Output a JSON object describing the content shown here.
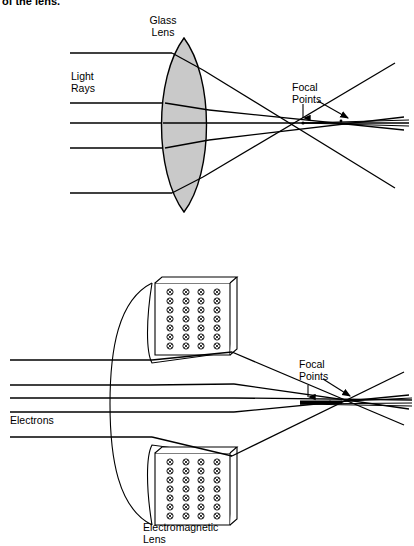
{
  "page": {
    "width": 414,
    "height": 546,
    "background": "#ffffff",
    "ink": "#000000",
    "clipped_text_top": "of the lens."
  },
  "figure": {
    "title_visible": false,
    "panels": [
      {
        "id": "glass-lens-panel",
        "name": "Glass Lens Diagram",
        "labels": {
          "lens": "Glass\nLens",
          "lens_line1": "Glass",
          "lens_line2": "Lens",
          "source": "Light\nRays",
          "source_line1": "Light",
          "source_line2": "Rays",
          "focus": "Focal\nPoints",
          "focus_line1": "Focal",
          "focus_line2": "Points"
        },
        "lens": {
          "type": "biconvex",
          "fill": "#c9c9c9",
          "stroke": "#000000",
          "center_x": 184,
          "top_y": 38,
          "bottom_y": 212,
          "half_width": 30
        },
        "rays": {
          "count": 5,
          "entry_y": [
            53,
            103,
            123,
            148,
            193
          ],
          "start_x": 70
        },
        "focal_points": [
          {
            "x": 303,
            "y": 123
          },
          {
            "x": 341,
            "y": 121
          }
        ]
      },
      {
        "id": "electromagnetic-lens-panel",
        "name": "Electromagnetic Lens Diagram",
        "labels": {
          "lens": "Electromagnetic\nLens",
          "lens_line1": "Electromagnetic",
          "lens_line2": "Lens",
          "source": "Electrons",
          "focus": "Focal\nPoints",
          "focus_line1": "Focal",
          "focus_line2": "Points"
        },
        "coils": {
          "symbol": "circled-x",
          "symbol_meaning": "current into page",
          "rows": 7,
          "columns": 4,
          "count_per_box": 28,
          "boxes": 2,
          "fill": "#ffffff",
          "stroke": "#000000"
        },
        "rays": {
          "count": 5,
          "entry_y": [
            360,
            385,
            398,
            412,
            437
          ],
          "start_x": 10
        },
        "focal_points": [
          {
            "x": 308,
            "y": 404
          },
          {
            "x": 330,
            "y": 402
          }
        ]
      }
    ]
  }
}
